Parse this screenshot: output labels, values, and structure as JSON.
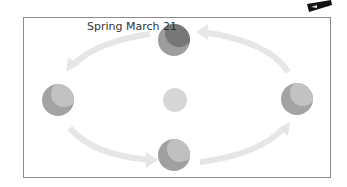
{
  "diagram": {
    "label": "Spring March 21",
    "sun": {
      "cx": 175,
      "cy": 100,
      "r": 12,
      "color": "#d6d6d6"
    },
    "planets": [
      {
        "name": "top",
        "cx": 174,
        "cy": 40,
        "r": 16,
        "base": "#9d9d9d",
        "shade": "#777777"
      },
      {
        "name": "left",
        "cx": 58,
        "cy": 100,
        "r": 16,
        "base": "#a3a3a3",
        "shade": "#c2c2c2"
      },
      {
        "name": "right",
        "cx": 297,
        "cy": 99,
        "r": 16,
        "base": "#a3a3a3",
        "shade": "#c2c2c2"
      },
      {
        "name": "bottom",
        "cx": 174,
        "cy": 155,
        "r": 16,
        "base": "#a0a0a0",
        "shade": "#c0c0c0"
      }
    ],
    "arrow_color": "#e6e6e6"
  }
}
